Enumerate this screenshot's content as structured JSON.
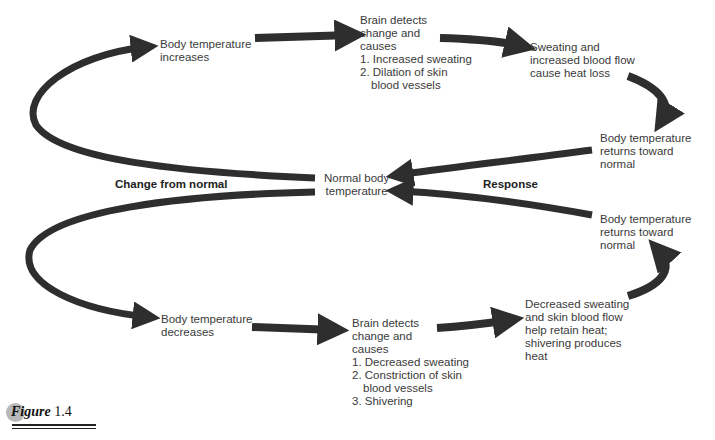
{
  "figure": {
    "label_word": "Figure",
    "label_number": "1.4"
  },
  "colors": {
    "arrow": "#2e2e2e",
    "text": "#3a3a3a",
    "caption_circle": "#b8b8b8"
  },
  "center": {
    "lines": [
      "Normal body",
      "temperature"
    ]
  },
  "side_labels": {
    "left": "Change from normal",
    "right": "Response"
  },
  "upper_loop": {
    "stimulus": {
      "lines": [
        "Body temperature",
        "increases"
      ]
    },
    "control": {
      "lines": [
        "Brain detects",
        "change and",
        "causes"
      ],
      "steps": [
        "1. Increased sweating",
        "2. Dilation of skin"
      ],
      "continuation": "blood vessels"
    },
    "effect": {
      "lines": [
        "Sweating and",
        "increased blood flow",
        "cause heat loss"
      ]
    },
    "result": {
      "lines": [
        "Body temperature",
        "returns toward",
        "normal"
      ]
    }
  },
  "lower_loop": {
    "stimulus": {
      "lines": [
        "Body temperature",
        "decreases"
      ]
    },
    "control": {
      "lines": [
        "Brain detects",
        "change and",
        "causes"
      ],
      "steps": [
        "1. Decreased sweating",
        "2. Constriction of skin"
      ],
      "continuation": "blood vessels",
      "steps_after": [
        "3. Shivering"
      ]
    },
    "effect": {
      "lines": [
        "Decreased sweating",
        "and skin blood flow",
        "help retain heat;",
        "shivering produces",
        "heat"
      ]
    },
    "result": {
      "lines": [
        "Body temperature",
        "returns toward",
        "normal"
      ]
    }
  }
}
